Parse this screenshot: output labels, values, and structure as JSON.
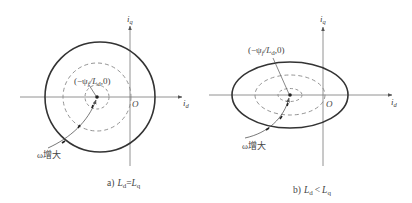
{
  "colors": {
    "curve": "#333333",
    "dashed": "#888888",
    "axis": "#777777",
    "text": "#444444"
  },
  "panels": [
    {
      "id": "a",
      "caption_prefix": "a)",
      "caption_lhs": "L",
      "caption_lhs_sub": "d",
      "caption_op": "=",
      "caption_rhs": "L",
      "caption_rhs_sub": "q",
      "axis_x_label": "i",
      "axis_x_sub": "d",
      "axis_y_label": "i",
      "axis_y_sub": "q",
      "origin_label": "O",
      "center_label": "(−ψ",
      "center_label_sub": "f",
      "center_label_mid": "/L",
      "center_label_sub2": "d",
      "center_label_end": ",0)",
      "omega_label": "ω增大",
      "shape": "circle"
    },
    {
      "id": "b",
      "caption_prefix": "b)",
      "caption_lhs": "L",
      "caption_lhs_sub": "d",
      "caption_op": "<",
      "caption_rhs": "L",
      "caption_rhs_sub": "q",
      "axis_x_label": "i",
      "axis_x_sub": "d",
      "axis_y_label": "i",
      "axis_y_sub": "q",
      "origin_label": "O",
      "center_label": "(−ψ",
      "center_label_sub": "f",
      "center_label_mid": "/L",
      "center_label_sub2": "d",
      "center_label_end": ",0)",
      "omega_label": "ω增大",
      "shape": "ellipse"
    }
  ]
}
